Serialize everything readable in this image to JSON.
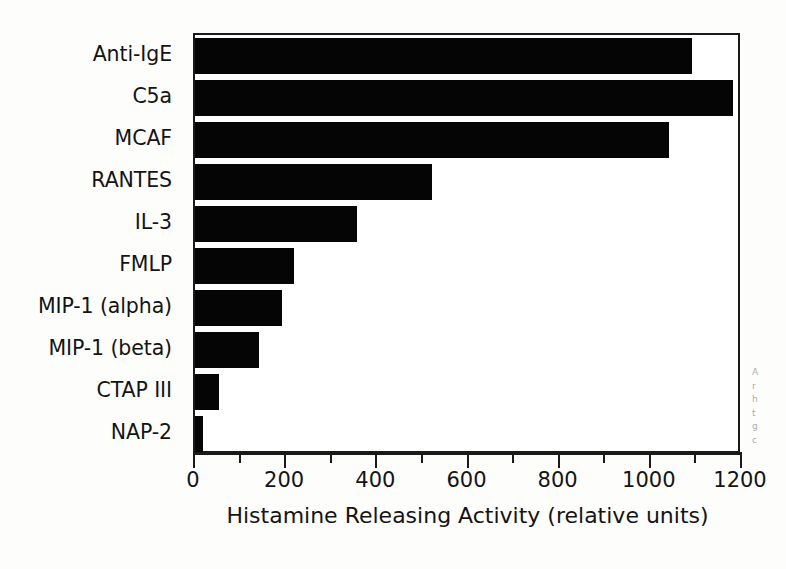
{
  "chart_data": {
    "type": "bar",
    "orientation": "horizontal",
    "title": "",
    "xlabel": "Histamine Releasing Activity (relative units)",
    "ylabel": "",
    "xlim": [
      0,
      1200
    ],
    "xticks": [
      0,
      200,
      400,
      600,
      800,
      1000,
      1200
    ],
    "xtick_labels": [
      "0",
      "200",
      "400",
      "600",
      "800",
      "1000",
      "1200"
    ],
    "minor_tick_interval": 100,
    "grid": false,
    "legend": null,
    "bar_color": "#050505",
    "categories": [
      "Anti-IgE",
      "C5a",
      "MCAF",
      "RANTES",
      "IL-3",
      "FMLP",
      "MIP-1 (alpha)",
      "MIP-1 (beta)",
      "CTAP III",
      "NAP-2"
    ],
    "values": [
      1090,
      1180,
      1040,
      520,
      355,
      218,
      190,
      140,
      52,
      18
    ]
  },
  "margin_caption": {
    "lines": [
      "A",
      "r",
      "h",
      "t",
      "g",
      "c"
    ]
  }
}
